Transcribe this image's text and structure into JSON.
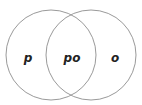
{
  "diagram": {
    "type": "venn",
    "circles": [
      {
        "id": "left",
        "cx": 51,
        "cy": 55,
        "r": 45,
        "stroke": "#9a9a9a"
      },
      {
        "id": "right",
        "cx": 91,
        "cy": 55,
        "r": 45,
        "stroke": "#9a9a9a"
      }
    ],
    "labels": {
      "left_only": "p",
      "intersection": "po",
      "right_only": "o"
    }
  }
}
